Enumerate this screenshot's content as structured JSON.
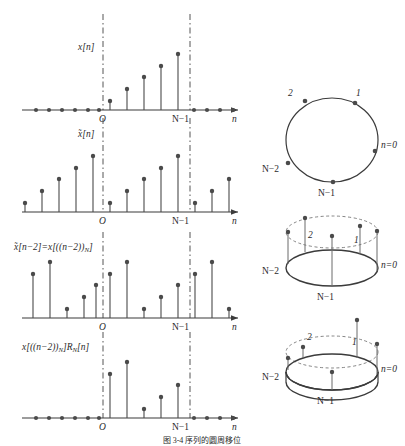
{
  "figure": {
    "caption": "图 3-4  序列的圆周移位",
    "axis_label_n": "n",
    "origin_label": "O",
    "window_end_label": "N−1",
    "stroke": "#3b3b3b",
    "dash_color": "#555555"
  },
  "plots": [
    {
      "id": "plot-original",
      "label": "x[n]",
      "x_axis": "n",
      "origin": "O",
      "window_end": "N−1",
      "N": 5,
      "values": [
        1,
        2,
        3,
        4,
        5
      ],
      "zeros_left": 6,
      "zeros_right": 6,
      "description": "finite-length ramp sequence, zero outside 0..N-1"
    },
    {
      "id": "plot-periodic",
      "label": "̃x[n]",
      "x_axis": "n",
      "origin": "O",
      "window_end": "N−1",
      "N": 5,
      "values": [
        1,
        2,
        3,
        4,
        5
      ],
      "periods": 3,
      "description": "periodic extension of x[n] with period N"
    },
    {
      "id": "plot-periodic-shifted",
      "label": "̃x[n−2]=x[((n−2))ₙ]",
      "label_parts": {
        "main": "̃x[n−2]=x[((n−2))",
        "subscript": "N",
        "tail": "]"
      },
      "x_axis": "n",
      "origin": "O",
      "window_end": "N−1",
      "N": 5,
      "shift": 2,
      "values": [
        4,
        5,
        1,
        2,
        3
      ],
      "periods": 3,
      "description": "periodic sequence delayed by 2 samples"
    },
    {
      "id": "plot-windowed",
      "label": "x[((n−2))ₙ]Rₙ[n]",
      "label_parts": {
        "main": "x[((n−2))",
        "subscript": "N",
        "mid": "]R",
        "subscript2": "N",
        "tail": "[n]"
      },
      "x_axis": "n",
      "origin": "O",
      "window_end": "N−1",
      "N": 5,
      "values": [
        4,
        5,
        1,
        2,
        3
      ],
      "zeros_left": 6,
      "zeros_right": 6,
      "description": "circularly shifted sequence after rectangular window R_N[n]"
    }
  ],
  "circles": [
    {
      "id": "circle-flat",
      "type": "flat-circle",
      "labels": [
        "n=0",
        "1",
        "2",
        "N−2",
        "N−1"
      ],
      "description": "samples arranged on a circle, index increases counter-clockwise"
    },
    {
      "id": "circle-stems-original",
      "type": "perspective-disc-with-stems",
      "labels": [
        "n=0",
        "1",
        "2",
        "N−2",
        "N−1"
      ],
      "stem_values": [
        5,
        4,
        3,
        1,
        2
      ],
      "description": "sequence values shown as vertical stems on the circle"
    },
    {
      "id": "circle-stems-rotated",
      "type": "perspective-disc-with-stems",
      "labels": [
        "n=0",
        "1",
        "2",
        "N−2",
        "N−1"
      ],
      "stem_values": [
        3,
        5,
        4,
        2,
        1
      ],
      "description": "circle rotated by two positions, illustrating circular shift"
    }
  ]
}
